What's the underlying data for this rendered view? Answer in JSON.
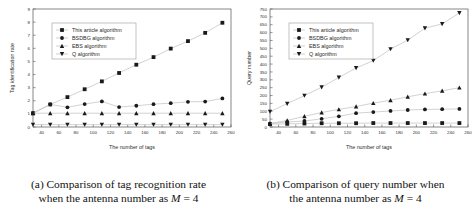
{
  "figure": {
    "panels": [
      {
        "id": "panel-a",
        "caption_line1": "(a) Comparison of tag recognition rate",
        "caption_line2_pre": "when the antenna number as",
        "caption_line2_var": "M",
        "caption_line2_post": "= 4"
      },
      {
        "id": "panel-b",
        "caption_line1": "(b) Comparison of query number when",
        "caption_line2_pre": "the antenna number as",
        "caption_line2_var": "M",
        "caption_line2_post": "= 4"
      }
    ]
  },
  "chart_data": [
    {
      "type": "line",
      "title": "",
      "xlabel": "The number of tags",
      "ylabel": "Tag identification rate",
      "xlim": [
        30,
        260
      ],
      "ylim": [
        0,
        9
      ],
      "xticks": [
        40,
        60,
        80,
        100,
        120,
        140,
        160,
        180,
        200,
        220,
        240,
        260
      ],
      "yticks": [
        0,
        1,
        2,
        3,
        4,
        5,
        6,
        7,
        8,
        9
      ],
      "grid": false,
      "legend_position": "upper-left",
      "x": [
        30,
        50,
        70,
        90,
        110,
        130,
        150,
        170,
        190,
        210,
        230,
        250
      ],
      "series": [
        {
          "name": "This article algorithm",
          "marker": "square",
          "values": [
            1.05,
            1.72,
            2.28,
            2.88,
            3.48,
            4.12,
            4.75,
            5.33,
            5.98,
            6.55,
            7.18,
            7.95
          ]
        },
        {
          "name": "BSDBG algorithm",
          "marker": "circle",
          "values": [
            1.05,
            1.72,
            1.5,
            1.75,
            1.95,
            1.52,
            1.62,
            1.74,
            1.82,
            1.92,
            1.94,
            2.18
          ]
        },
        {
          "name": "EBS algorithm",
          "marker": "triangle-up",
          "values": [
            1.05,
            1.05,
            1.05,
            1.05,
            1.05,
            1.05,
            1.05,
            1.05,
            1.05,
            1.05,
            1.05,
            1.05
          ]
        },
        {
          "name": "Q algorithm",
          "marker": "triangle-down",
          "values": [
            0.18,
            0.18,
            0.18,
            0.18,
            0.18,
            0.18,
            0.18,
            0.18,
            0.18,
            0.18,
            0.18,
            0.18
          ]
        }
      ]
    },
    {
      "type": "line",
      "title": "",
      "xlabel": "The number of tags",
      "ylabel": "Query number",
      "xlim": [
        30,
        260
      ],
      "ylim": [
        0,
        750
      ],
      "xticks": [
        40,
        60,
        80,
        100,
        120,
        140,
        160,
        180,
        200,
        220,
        240,
        260
      ],
      "yticks": [
        0,
        50,
        100,
        150,
        200,
        250,
        300,
        350,
        400,
        450,
        500,
        550,
        600,
        650,
        700,
        750
      ],
      "grid": false,
      "legend_position": "upper-left",
      "x": [
        30,
        50,
        70,
        90,
        110,
        130,
        150,
        170,
        190,
        210,
        230,
        250
      ],
      "series": [
        {
          "name": "This article algorithm",
          "marker": "square",
          "values": [
            18,
            20,
            22,
            24,
            24,
            24,
            25,
            25,
            25,
            25,
            25,
            25
          ]
        },
        {
          "name": "BSDBG algorithm",
          "marker": "circle",
          "values": [
            22,
            32,
            38,
            52,
            68,
            88,
            95,
            102,
            108,
            112,
            113,
            115
          ]
        },
        {
          "name": "EBS algorithm",
          "marker": "triangle-up",
          "values": [
            22,
            42,
            68,
            92,
            112,
            130,
            152,
            170,
            192,
            212,
            230,
            250
          ]
        },
        {
          "name": "Q algorithm",
          "marker": "triangle-down",
          "values": [
            98,
            148,
            200,
            253,
            315,
            375,
            422,
            495,
            552,
            628,
            655,
            725
          ]
        }
      ]
    }
  ],
  "colors": {
    "line": "#bfbfbf",
    "marker": "#1a1a1a",
    "axis": "#555555",
    "legend_border": "#9a9a9a",
    "text": "#2b2b2b"
  }
}
